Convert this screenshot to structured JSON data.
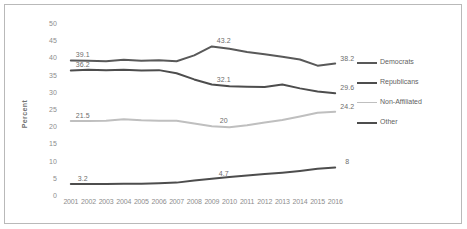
{
  "chart_data": {
    "type": "line",
    "title": "",
    "xlabel": "",
    "ylabel": "Percent",
    "ylim": [
      0,
      50
    ],
    "ytick_step": 5,
    "grid": false,
    "legend_position": "right",
    "x": [
      2001,
      2002,
      2003,
      2004,
      2005,
      2006,
      2007,
      2008,
      2009,
      2010,
      2011,
      2012,
      2013,
      2014,
      2015,
      2016
    ],
    "yticks": [
      "0",
      "5",
      "10",
      "15",
      "20",
      "25",
      "30",
      "35",
      "40",
      "45",
      "50"
    ],
    "xticks": [
      "2001",
      "2002",
      "2003",
      "2004",
      "2005",
      "2006",
      "2007",
      "2008",
      "2009",
      "2010",
      "2011",
      "2012",
      "2013",
      "2014",
      "2015",
      "2016"
    ],
    "series": [
      {
        "name": "Democrats",
        "color": "#595959",
        "width": 2.0,
        "values": [
          39.1,
          39.0,
          38.9,
          39.3,
          39.0,
          39.2,
          38.9,
          40.6,
          43.2,
          42.5,
          41.6,
          40.9,
          40.2,
          39.4,
          37.6,
          38.2
        ],
        "labels": [
          {
            "x": 2001,
            "value": 39.1,
            "text": "39.1"
          },
          {
            "x": 2009,
            "value": 43.2,
            "text": "43.2"
          },
          {
            "x": 2016,
            "value": 38.2,
            "text": "38.2"
          }
        ]
      },
      {
        "name": "Republicans",
        "color": "#4d4d4d",
        "width": 2.0,
        "values": [
          36.2,
          36.4,
          36.3,
          36.4,
          36.2,
          36.3,
          35.4,
          33.6,
          32.1,
          31.6,
          31.5,
          31.4,
          32.1,
          31.0,
          30.1,
          29.6
        ],
        "labels": [
          {
            "x": 2001,
            "value": 36.2,
            "text": "36.2"
          },
          {
            "x": 2009,
            "value": 32.1,
            "text": "32.1"
          },
          {
            "x": 2016,
            "value": 29.6,
            "text": "29.6"
          }
        ]
      },
      {
        "name": "Non-Affiliated",
        "color": "#bfbfbf",
        "width": 2.0,
        "values": [
          21.5,
          21.5,
          21.6,
          22.0,
          21.7,
          21.6,
          21.6,
          20.8,
          20.0,
          19.7,
          20.3,
          21.1,
          21.8,
          22.8,
          23.9,
          24.2
        ],
        "labels": [
          {
            "x": 2001,
            "value": 21.5,
            "text": "21.5"
          },
          {
            "x": 2009,
            "value": 20.0,
            "text": "20"
          },
          {
            "x": 2016,
            "value": 24.2,
            "text": "24.2"
          }
        ]
      },
      {
        "name": "Other",
        "color": "#4d4d4d",
        "width": 2.0,
        "values": [
          3.2,
          3.2,
          3.2,
          3.3,
          3.3,
          3.4,
          3.6,
          4.2,
          4.7,
          5.2,
          5.7,
          6.1,
          6.5,
          7.0,
          7.6,
          8.0
        ],
        "labels": [
          {
            "x": 2001,
            "value": 3.2,
            "text": "3.2"
          },
          {
            "x": 2009,
            "value": 4.7,
            "text": "4.7"
          },
          {
            "x": 2016,
            "value": 8.0,
            "text": "8"
          }
        ]
      }
    ],
    "legend": [
      {
        "label": "Democrats",
        "color": "#595959",
        "width": 2.0
      },
      {
        "label": "Republicans",
        "color": "#4d4d4d",
        "width": 2.0
      },
      {
        "label": "Non-Affiliated",
        "color": "#bfbfbf",
        "width": 1.3
      },
      {
        "label": "Other",
        "color": "#4d4d4d",
        "width": 2.0
      }
    ]
  }
}
